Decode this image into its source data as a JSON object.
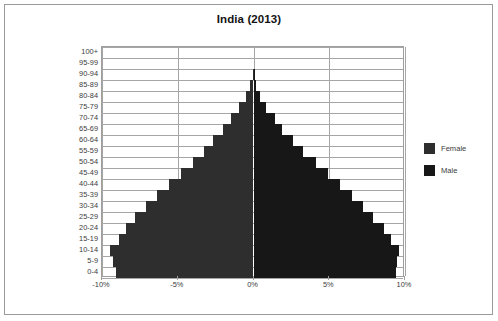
{
  "chart_data": {
    "type": "bar",
    "subtype": "population-pyramid",
    "title": "India (2013)",
    "xlabel": "",
    "ylabel": "",
    "xlim": [
      -10,
      10
    ],
    "xticks": [
      -10,
      -5,
      0,
      5,
      10
    ],
    "xtick_labels": [
      "-10%",
      "-5%",
      "0%",
      "5%",
      "10%"
    ],
    "grid": true,
    "legend_position": "right",
    "categories": [
      "0-4",
      "5-9",
      "10-14",
      "15-19",
      "20-24",
      "25-29",
      "30-34",
      "35-39",
      "40-44",
      "45-49",
      "50-54",
      "55-59",
      "60-64",
      "65-69",
      "70-74",
      "75-79",
      "80-84",
      "85-89",
      "90-94",
      "95-99",
      "100+"
    ],
    "series": [
      {
        "name": "Female",
        "color": "#2e2e2e",
        "side": "left",
        "values": [
          9.1,
          9.3,
          9.5,
          8.9,
          8.4,
          7.8,
          7.1,
          6.4,
          5.6,
          4.8,
          4.0,
          3.3,
          2.7,
          2.0,
          1.5,
          0.95,
          0.5,
          0.2,
          0.06,
          0.01,
          0.0
        ]
      },
      {
        "name": "Male",
        "color": "#171717",
        "side": "right",
        "values": [
          9.4,
          9.5,
          9.6,
          9.1,
          8.6,
          7.9,
          7.2,
          6.5,
          5.7,
          4.9,
          4.1,
          3.3,
          2.6,
          1.9,
          1.4,
          0.85,
          0.45,
          0.17,
          0.05,
          0.01,
          0.0
        ]
      }
    ]
  },
  "legend": {
    "items": [
      {
        "label": "Female",
        "color": "#2e2e2e"
      },
      {
        "label": "Male",
        "color": "#171717"
      }
    ]
  }
}
